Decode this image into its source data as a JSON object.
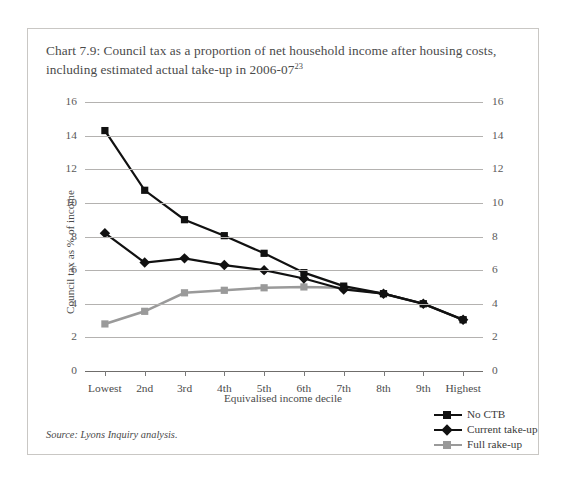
{
  "title": {
    "text": "Chart 7.9: Council tax as a proportion of net household income after housing costs, including estimated actual take-up in 2006-07",
    "footnote_marker": "23"
  },
  "source_note": "Source: Lyons Inquiry analysis.",
  "colors": {
    "series_no_ctb": "#111111",
    "series_current_takeup": "#111111",
    "series_full_rakeup": "#9a9a9a",
    "gridline": "#b4b2b0",
    "axis": "#6f6d6b",
    "frame_border": "#c9c7c4",
    "text": "#3a3a3a",
    "background": "#ffffff"
  },
  "chart_data": {
    "type": "line",
    "title": "Chart 7.9: Council tax as a proportion of net household income after housing costs, including estimated actual take-up in 2006-07",
    "xlabel": "Equivalised income decile",
    "ylabel": "Council tax as % of income",
    "categories": [
      "Lowest",
      "2nd",
      "3rd",
      "4th",
      "5th",
      "6th",
      "7th",
      "8th",
      "9th",
      "Highest"
    ],
    "ylim": [
      0,
      16
    ],
    "yticks": [
      0,
      2,
      4,
      6,
      8,
      10,
      12,
      14,
      16
    ],
    "ytick_labels": [
      "0",
      "2",
      "4",
      "6",
      "8",
      "10",
      "12",
      "14",
      "16"
    ],
    "grid": true,
    "dual_y_axis": true,
    "legend_position": "bottom-right",
    "series": [
      {
        "name": "No CTB",
        "color": "#111111",
        "marker": "square",
        "values": [
          14.3,
          10.75,
          9.0,
          8.05,
          7.0,
          5.85,
          5.05,
          4.6,
          4.0,
          3.05
        ]
      },
      {
        "name": "Current take-up",
        "color": "#111111",
        "marker": "diamond",
        "values": [
          8.2,
          6.45,
          6.7,
          6.3,
          6.0,
          5.5,
          4.85,
          4.6,
          4.0,
          3.05
        ]
      },
      {
        "name": "Full rake-up",
        "color": "#9a9a9a",
        "marker": "square",
        "values": [
          2.8,
          3.55,
          4.65,
          4.8,
          4.95,
          5.0,
          4.95,
          4.6,
          4.0,
          3.05
        ]
      }
    ]
  }
}
